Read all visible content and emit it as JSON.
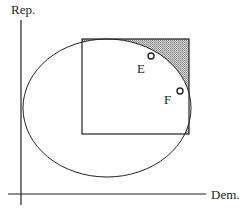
{
  "axes": {
    "y_label": "Rep.",
    "x_label": "Dem."
  },
  "points": [
    {
      "label": "E",
      "cx": 151,
      "cy": 56
    },
    {
      "label": "F",
      "cx": 180,
      "cy": 91
    }
  ],
  "colors": {
    "line": "#222222",
    "shade": "#b8b8b8",
    "background": "#ffffff"
  }
}
